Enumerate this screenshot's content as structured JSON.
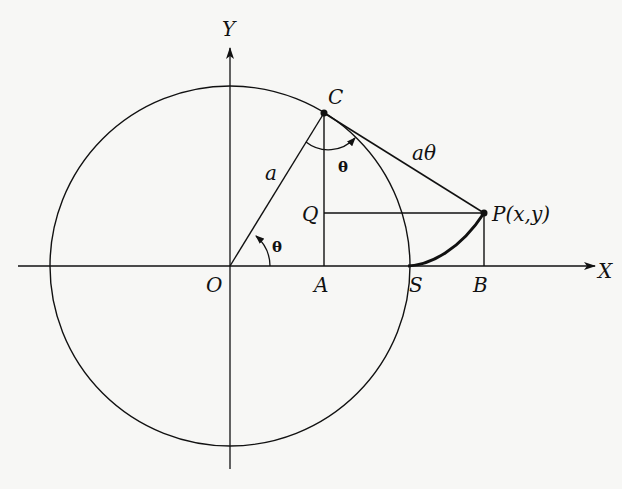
{
  "diagram": {
    "colors": {
      "background": "#f7f7f5",
      "ink": "#111111"
    },
    "labels": {
      "y_axis": "Y",
      "x_axis": "X",
      "origin": "O",
      "point_c": "C",
      "point_a": "A",
      "point_q": "Q",
      "point_s": "S",
      "point_b": "B",
      "point_p": "P(x,y)",
      "radius": "a",
      "arc_length": "aθ",
      "angle_at_o": "θ",
      "angle_at_c": "θ"
    },
    "geometry": {
      "origin": [
        230,
        266
      ],
      "radius": 179,
      "C": [
        324,
        113
      ],
      "A": [
        324,
        266
      ],
      "Q": [
        324,
        213
      ],
      "P": [
        484,
        213
      ],
      "B": [
        484,
        266
      ],
      "S": [
        408,
        266
      ]
    }
  }
}
